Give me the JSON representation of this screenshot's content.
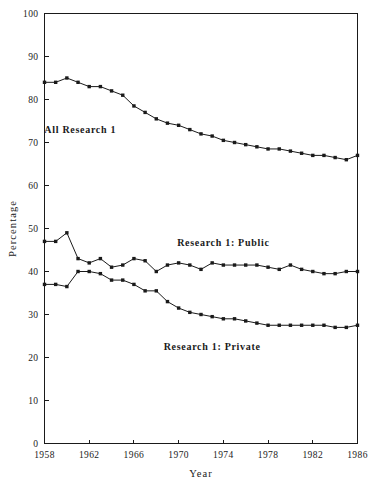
{
  "chart_data": {
    "type": "line",
    "title": "",
    "xlabel": "Year",
    "ylabel": "Percentage",
    "xlim": [
      1958,
      1986
    ],
    "ylim": [
      0,
      100
    ],
    "grid": false,
    "legend_position": "inline-annotations",
    "x": [
      1958,
      1959,
      1960,
      1961,
      1962,
      1963,
      1964,
      1965,
      1966,
      1967,
      1968,
      1969,
      1970,
      1971,
      1972,
      1973,
      1974,
      1975,
      1976,
      1977,
      1978,
      1979,
      1980,
      1981,
      1982,
      1983,
      1984,
      1985,
      1986
    ],
    "xtick_labels": [
      "1958",
      "1962",
      "1966",
      "1970",
      "1974",
      "1978",
      "1982",
      "1986"
    ],
    "xtick_values": [
      1958,
      1962,
      1966,
      1970,
      1974,
      1978,
      1982,
      1986
    ],
    "ytick_labels": [
      "0",
      "10",
      "20",
      "30",
      "40",
      "50",
      "60",
      "70",
      "80",
      "90",
      "100"
    ],
    "ytick_values": [
      0,
      10,
      20,
      30,
      40,
      50,
      60,
      70,
      80,
      90,
      100
    ],
    "series": [
      {
        "name": "All Research 1",
        "label_text": "All Research 1",
        "color": "#1a1a1a",
        "marker": "square",
        "values": [
          84.0,
          84.0,
          85.0,
          84.0,
          83.0,
          83.0,
          82.0,
          81.0,
          78.5,
          77.0,
          75.5,
          74.5,
          74.0,
          73.0,
          72.0,
          71.5,
          70.5,
          70.0,
          69.5,
          69.0,
          68.5,
          68.5,
          68.0,
          67.5,
          67.0,
          67.0,
          66.5,
          66.0,
          67.0
        ]
      },
      {
        "name": "Research 1: Public",
        "label_text": "Research 1: Public",
        "color": "#1a1a1a",
        "marker": "square",
        "values": [
          47.0,
          47.0,
          49.0,
          43.0,
          42.0,
          43.0,
          41.0,
          41.5,
          43.0,
          42.5,
          40.0,
          41.5,
          42.0,
          41.5,
          40.5,
          42.0,
          41.5,
          41.5,
          41.5,
          41.5,
          41.0,
          40.5,
          41.5,
          40.5,
          40.0,
          39.5,
          39.5,
          40.0,
          40.0
        ]
      },
      {
        "name": "Research 1: Private",
        "label_text": "Research 1: Private",
        "color": "#1a1a1a",
        "marker": "square",
        "values": [
          37.0,
          37.0,
          36.5,
          40.0,
          40.0,
          39.5,
          38.0,
          38.0,
          37.0,
          35.5,
          35.5,
          33.0,
          31.5,
          30.5,
          30.0,
          29.5,
          29.0,
          29.0,
          28.5,
          28.0,
          27.5,
          27.5,
          27.5,
          27.5,
          27.5,
          27.5,
          27.0,
          27.0,
          27.5
        ]
      }
    ],
    "annotations": [
      {
        "text": "All Research 1",
        "x": 1961.2,
        "y": 72.2
      },
      {
        "text": "Research 1: Public",
        "x": 1974.0,
        "y": 46.0
      },
      {
        "text": "Research 1: Private",
        "x": 1973.0,
        "y": 21.8
      }
    ]
  }
}
